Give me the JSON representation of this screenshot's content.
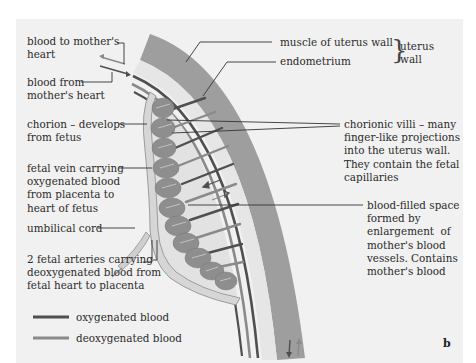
{
  "figure": {
    "panel_letter": "b",
    "colors": {
      "background": "#f1f1f1",
      "muscle": "#9e9e9e",
      "endometrium": "#e4e4e4",
      "oxygenated_blood": "#4f4f4f",
      "deoxygenated_blood": "#8a8a8a",
      "villi": "#8e8e8e",
      "label_text": "#2b2b2b"
    },
    "labels": {
      "blood_to_mother": "blood to mother's\nheart",
      "blood_from_mother": "blood from\nmother's heart",
      "chorion": "chorion – develops\nfrom fetus",
      "fetal_vein": "fetal vein carrying\noxygenated blood\nfrom placenta to\nheart of fetus",
      "umbilical_cord": "umbilical cord",
      "fetal_arteries": "2 fetal arteries carrying\ndeoxygenated blood from\nfetal heart to placenta",
      "muscle": "muscle of uterus wall",
      "endometrium": "endometrium",
      "uterus_wall": "uterus\nwall",
      "chorionic_villi": "chorionic villi – many\nfinger-like projections\ninto the uterus wall.\nThey contain the fetal\ncapillaries",
      "blood_space": "blood-filled space\nformed by\nenlargement  of\nmother's blood\nvessels. Contains\nmother's blood"
    },
    "legend": [
      {
        "label": "oxygenated blood",
        "color": "#4f4f4f"
      },
      {
        "label": "deoxygenated blood",
        "color": "#8a8a8a"
      }
    ]
  }
}
